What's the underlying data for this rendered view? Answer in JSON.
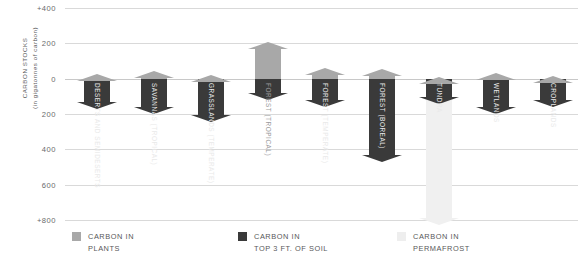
{
  "chart_data": {
    "type": "bar",
    "title": "",
    "ylabel": "CARBON STOCKS (in gigatonnes of carbon)",
    "ylabel_line1": "CARBON STOCKS",
    "ylabel_line2": "(in gigatonnes of carbon)",
    "xlabel": "",
    "ylim": [
      -800,
      400
    ],
    "grid": true,
    "legend_position": "bottom",
    "ytick_labels": [
      "+400",
      "200",
      "0",
      "200",
      "400",
      "600",
      "+800"
    ],
    "ytick_values": [
      400,
      200,
      0,
      -200,
      -400,
      -600,
      -800
    ],
    "categories": [
      "DESERTS AND SEMIDESERTS",
      "SAVANNAS (TROPICAL)",
      "GRASSLANDS (TEMPERATE)",
      "FOREST (TROPICAL)",
      "FOREST (TEMPERATE)",
      "FOREST (BOREAL)",
      "TUNDRA",
      "WETLANDS",
      "CROPLANDS"
    ],
    "series": [
      {
        "name": "CARBON IN PLANTS",
        "key": "plants",
        "color": "#a8a8a8",
        "values": [
          25,
          45,
          20,
          210,
          60,
          55,
          10,
          30,
          15
        ]
      },
      {
        "name": "CARBON IN TOP 3 FT. OF SOIL",
        "key": "soil",
        "color": "#3a3a3a",
        "values": [
          -170,
          -200,
          -245,
          -120,
          -160,
          -470,
          -145,
          -200,
          -160
        ]
      },
      {
        "name": "CARBON IN PERMAFROST",
        "key": "permafrost",
        "color": "#f0f0f0",
        "values": [
          0,
          0,
          0,
          0,
          0,
          0,
          -830,
          0,
          0
        ]
      }
    ],
    "bars": [
      {
        "label": "DESERTS AND SEMIDESERTS",
        "plants": 25,
        "soil": -170,
        "permafrost": 0,
        "label_color": "light"
      },
      {
        "label": "SAVANNAS (TROPICAL)",
        "plants": 45,
        "soil": -200,
        "permafrost": 0,
        "label_color": "light"
      },
      {
        "label": "GRASSLANDS (TEMPERATE)",
        "plants": 20,
        "soil": -245,
        "permafrost": 0,
        "label_color": "light"
      },
      {
        "label": "FOREST (TROPICAL)",
        "plants": 210,
        "soil": -120,
        "permafrost": 0,
        "label_color": "dark"
      },
      {
        "label": "FOREST (TEMPERATE)",
        "plants": 60,
        "soil": -160,
        "permafrost": 0,
        "label_color": "light"
      },
      {
        "label": "FOREST (BOREAL)",
        "plants": 55,
        "soil": -470,
        "permafrost": 0,
        "label_color": "light"
      },
      {
        "label": "TUNDRA",
        "plants": 10,
        "soil": -145,
        "permafrost": -830,
        "label_color": "light"
      },
      {
        "label": "WETLANDS",
        "plants": 30,
        "soil": -200,
        "permafrost": 0,
        "label_color": "light"
      },
      {
        "label": "CROPLANDS",
        "plants": 15,
        "soil": -160,
        "permafrost": 0,
        "label_color": "light"
      }
    ],
    "legend": [
      {
        "label": "CARBON IN\nPLANTS",
        "color": "#a8a8a8"
      },
      {
        "label": "CARBON IN\nTOP 3 FT. OF SOIL",
        "color": "#3a3a3a"
      },
      {
        "label": "CARBON IN\nPERMAFROST",
        "color": "#eeeeee"
      }
    ],
    "colors": {
      "plants": "#a8a8a8",
      "soil": "#3a3a3a",
      "permafrost": "#f0f0f0",
      "grid": "#d9d9d9",
      "text": "#58585a",
      "background": "#ffffff"
    }
  }
}
